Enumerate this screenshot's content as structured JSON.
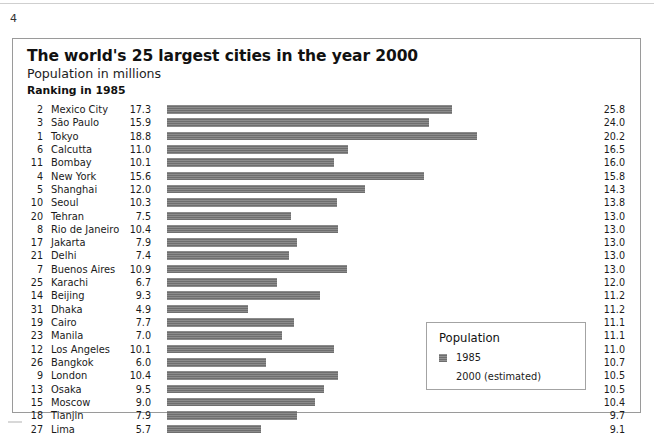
{
  "page": {
    "page_number": "4"
  },
  "figure": {
    "title": "The world's 25 largest cities in the year 2000",
    "subtitle": "Population in millions",
    "ranking_label": "Ranking in 1985"
  },
  "legend": {
    "title": "Population",
    "entries": [
      {
        "label": "1985",
        "swatch": "filled",
        "color": "#6e6e6e"
      },
      {
        "label": "2000 (estimated)",
        "swatch": "none",
        "color": "#ffffff"
      }
    ]
  },
  "chart_data": {
    "type": "bar",
    "title": "The world's 25 largest cities in the year 2000",
    "subtitle": "Population in millions",
    "xlabel": "",
    "ylabel": "",
    "orientation": "horizontal",
    "grid": false,
    "legend_position": "inside-bottom-right",
    "bar_series": "1985",
    "xlim": [
      0,
      19
    ],
    "columns": [
      "Ranking in 1985",
      "City",
      "1985",
      "2000 (estimated)"
    ],
    "categories": [
      "Mexico City",
      "São Paulo",
      "Tokyo",
      "Calcutta",
      "Bombay",
      "New York",
      "Shanghai",
      "Seoul",
      "Tehran",
      "Rio de Janeiro",
      "Jakarta",
      "Delhi",
      "Buenos Aires",
      "Karachi",
      "Beijing",
      "Dhaka",
      "Cairo",
      "Manila",
      "Los Angeles",
      "Bangkok",
      "London",
      "Osaka",
      "Moscow",
      "Tianjin",
      "Lima"
    ],
    "ranks_1985": [
      2,
      3,
      1,
      6,
      11,
      4,
      5,
      10,
      20,
      8,
      17,
      21,
      7,
      25,
      14,
      31,
      19,
      23,
      12,
      26,
      9,
      13,
      15,
      18,
      27
    ],
    "series": [
      {
        "name": "1985",
        "values": [
          17.3,
          15.9,
          18.8,
          11.0,
          10.1,
          15.6,
          12.0,
          10.3,
          7.5,
          10.4,
          7.9,
          7.4,
          10.9,
          6.7,
          9.3,
          4.9,
          7.7,
          7.0,
          10.1,
          6.0,
          10.4,
          9.5,
          9.0,
          7.9,
          5.7
        ]
      },
      {
        "name": "2000 (estimated)",
        "values": [
          25.8,
          24.0,
          20.2,
          16.5,
          16.0,
          15.8,
          14.3,
          13.8,
          13.0,
          13.0,
          13.0,
          13.0,
          13.0,
          12.0,
          11.2,
          11.2,
          11.1,
          11.1,
          11.0,
          10.7,
          10.5,
          10.5,
          10.4,
          9.7,
          9.1
        ]
      }
    ],
    "rows": [
      {
        "rank": "2",
        "city": "Mexico City",
        "v1985": "17.3",
        "v2000": "25.8"
      },
      {
        "rank": "3",
        "city": "São Paulo",
        "v1985": "15.9",
        "v2000": "24.0"
      },
      {
        "rank": "1",
        "city": "Tokyo",
        "v1985": "18.8",
        "v2000": "20.2"
      },
      {
        "rank": "6",
        "city": "Calcutta",
        "v1985": "11.0",
        "v2000": "16.5"
      },
      {
        "rank": "11",
        "city": "Bombay",
        "v1985": "10.1",
        "v2000": "16.0"
      },
      {
        "rank": "4",
        "city": "New York",
        "v1985": "15.6",
        "v2000": "15.8"
      },
      {
        "rank": "5",
        "city": "Shanghai",
        "v1985": "12.0",
        "v2000": "14.3"
      },
      {
        "rank": "10",
        "city": "Seoul",
        "v1985": "10.3",
        "v2000": "13.8"
      },
      {
        "rank": "20",
        "city": "Tehran",
        "v1985": "7.5",
        "v2000": "13.0"
      },
      {
        "rank": "8",
        "city": "Rio de Janeiro",
        "v1985": "10.4",
        "v2000": "13.0"
      },
      {
        "rank": "17",
        "city": "Jakarta",
        "v1985": "7.9",
        "v2000": "13.0"
      },
      {
        "rank": "21",
        "city": "Delhi",
        "v1985": "7.4",
        "v2000": "13.0"
      },
      {
        "rank": "7",
        "city": "Buenos Aires",
        "v1985": "10.9",
        "v2000": "13.0"
      },
      {
        "rank": "25",
        "city": "Karachi",
        "v1985": "6.7",
        "v2000": "12.0"
      },
      {
        "rank": "14",
        "city": "Beijing",
        "v1985": "9.3",
        "v2000": "11.2"
      },
      {
        "rank": "31",
        "city": "Dhaka",
        "v1985": "4.9",
        "v2000": "11.2"
      },
      {
        "rank": "19",
        "city": "Cairo",
        "v1985": "7.7",
        "v2000": "11.1"
      },
      {
        "rank": "23",
        "city": "Manila",
        "v1985": "7.0",
        "v2000": "11.1"
      },
      {
        "rank": "12",
        "city": "Los Angeles",
        "v1985": "10.1",
        "v2000": "11.0"
      },
      {
        "rank": "26",
        "city": "Bangkok",
        "v1985": "6.0",
        "v2000": "10.7"
      },
      {
        "rank": "9",
        "city": "London",
        "v1985": "10.4",
        "v2000": "10.5"
      },
      {
        "rank": "13",
        "city": "Osaka",
        "v1985": "9.5",
        "v2000": "10.5"
      },
      {
        "rank": "15",
        "city": "Moscow",
        "v1985": "9.0",
        "v2000": "10.4"
      },
      {
        "rank": "18",
        "city": "Tianjin",
        "v1985": "7.9",
        "v2000": "9.7"
      },
      {
        "rank": "27",
        "city": "Lima",
        "v1985": "5.7",
        "v2000": "9.1"
      }
    ]
  }
}
